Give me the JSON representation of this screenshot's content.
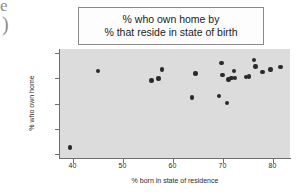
{
  "figure": {
    "artifacts": {
      "top_glyph": "e",
      "bottom_glyph": ")"
    },
    "title": {
      "line1": "% who own home by",
      "line2": "% that reside in state of birth"
    },
    "colors": {
      "plot_background": "#dcdcdc",
      "point_color": "#2a2a2a",
      "axis_color": "#6e6e6e",
      "title_box_background": "#fdfdfd",
      "title_box_border": "#8a8a8a",
      "page_background": "#ffffff"
    }
  },
  "chart_data": {
    "type": "scatter",
    "title": "% who own home by % that reside in state of birth",
    "xlabel": "% born in state of residence",
    "ylabel": "% who own home",
    "xlim": [
      37.5,
      83.5
    ],
    "ylim": [
      38.5,
      81.5
    ],
    "xticks": [
      40,
      50,
      60,
      70,
      80
    ],
    "yticks": [
      40,
      50,
      60,
      70,
      80
    ],
    "grid": false,
    "legend": null,
    "marker": "filled-circle",
    "points": [
      {
        "x": 39.5,
        "y": 42.7
      },
      {
        "x": 45.1,
        "y": 72.9
      },
      {
        "x": 55.8,
        "y": 69.1
      },
      {
        "x": 57.2,
        "y": 69.8
      },
      {
        "x": 57.9,
        "y": 73.4
      },
      {
        "x": 63.9,
        "y": 62.3
      },
      {
        "x": 64.6,
        "y": 71.9
      },
      {
        "x": 69.3,
        "y": 62.9
      },
      {
        "x": 69.8,
        "y": 76.1
      },
      {
        "x": 70.0,
        "y": 71.3
      },
      {
        "x": 70.9,
        "y": 60.2
      },
      {
        "x": 71.2,
        "y": 69.5
      },
      {
        "x": 71.8,
        "y": 70.1
      },
      {
        "x": 72.3,
        "y": 72.9
      },
      {
        "x": 72.5,
        "y": 70.0
      },
      {
        "x": 74.7,
        "y": 70.4
      },
      {
        "x": 75.3,
        "y": 70.6
      },
      {
        "x": 76.3,
        "y": 77.2
      },
      {
        "x": 76.6,
        "y": 74.6
      },
      {
        "x": 78.0,
        "y": 72.4
      },
      {
        "x": 79.6,
        "y": 73.4
      },
      {
        "x": 81.6,
        "y": 74.4
      }
    ]
  }
}
